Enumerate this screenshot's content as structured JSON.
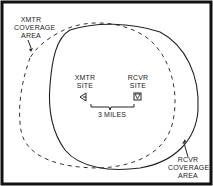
{
  "diagram": {
    "labels": {
      "xmtr_coverage": [
        "XMTR",
        "COVERAGE",
        "AREA"
      ],
      "rcvr_coverage": [
        "RCVR",
        "COVERAGE",
        "AREA"
      ],
      "xmtr_site": [
        "XMTR",
        "SITE"
      ],
      "rcvr_site": [
        "RCVR",
        "SITE"
      ],
      "distance": "3 MILES"
    },
    "elements": {
      "xmtr_coverage_boundary": "dashed",
      "rcvr_coverage_boundary": "solid",
      "xmtr_site_icon": "left-pointing-triangle",
      "rcvr_site_icon": "down-pointing-triangle"
    },
    "colors": {
      "line": "#222222",
      "frame": "#111111",
      "background": "#ffffff"
    }
  }
}
